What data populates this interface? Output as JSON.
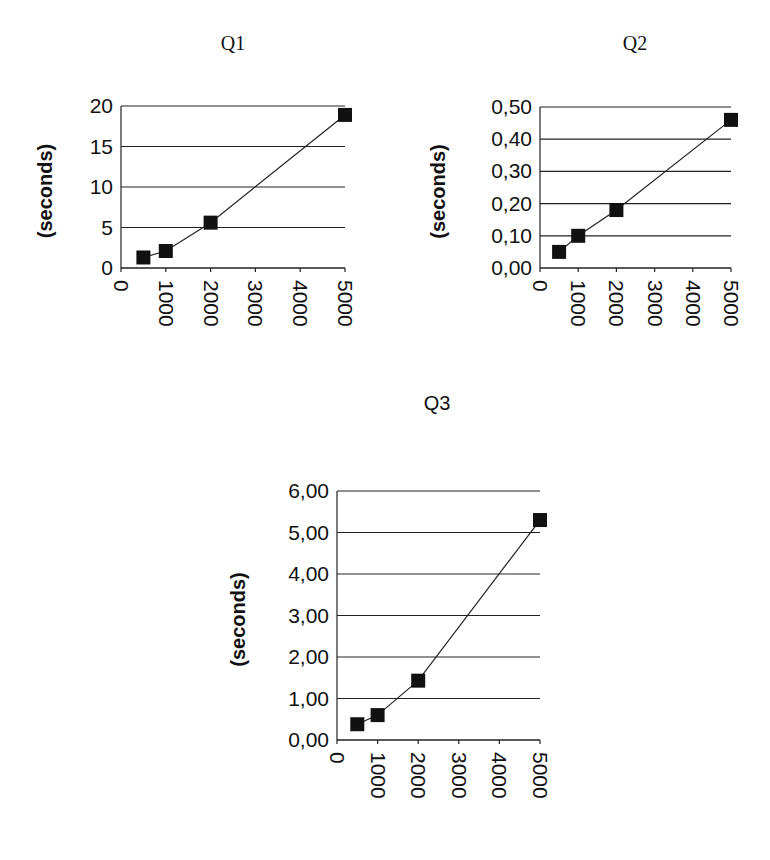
{
  "chart_data": [
    {
      "id": "q1",
      "type": "line",
      "title": "Q1",
      "xlabel": "",
      "ylabel": "(seconds)",
      "x": [
        500,
        1000,
        2000,
        5000
      ],
      "series": [
        {
          "name": "Q1",
          "values": [
            1.3,
            2.1,
            5.6,
            18.9
          ]
        }
      ],
      "xlim": [
        0,
        5000
      ],
      "ylim": [
        0,
        20
      ],
      "xticks": [
        "0",
        "1000",
        "2000",
        "3000",
        "4000",
        "5000"
      ],
      "yticks": [
        "0",
        "5",
        "10",
        "15",
        "20"
      ],
      "grid": "horizontal",
      "marker": "square",
      "legend": "none"
    },
    {
      "id": "q2",
      "type": "line",
      "title": "Q2",
      "xlabel": "",
      "ylabel": "(seconds)",
      "x": [
        500,
        1000,
        2000,
        5000
      ],
      "series": [
        {
          "name": "Q2",
          "values": [
            0.05,
            0.1,
            0.18,
            0.46
          ]
        }
      ],
      "xlim": [
        0,
        5000
      ],
      "ylim": [
        0,
        0.5
      ],
      "xticks": [
        "0",
        "1000",
        "2000",
        "3000",
        "4000",
        "5000"
      ],
      "yticks": [
        "0,00",
        "0,10",
        "0,20",
        "0,30",
        "0,40",
        "0,50"
      ],
      "grid": "horizontal",
      "marker": "square",
      "legend": "none"
    },
    {
      "id": "q3",
      "type": "line",
      "title": "Q3",
      "xlabel": "",
      "ylabel": "(seconds)",
      "x": [
        500,
        1000,
        2000,
        5000
      ],
      "series": [
        {
          "name": "Q3",
          "values": [
            0.38,
            0.6,
            1.43,
            5.3
          ]
        }
      ],
      "xlim": [
        0,
        5000
      ],
      "ylim": [
        0,
        6
      ],
      "xticks": [
        "0",
        "1000",
        "2000",
        "3000",
        "4000",
        "5000"
      ],
      "yticks": [
        "0,00",
        "1,00",
        "2,00",
        "3,00",
        "4,00",
        "5,00",
        "6,00"
      ],
      "grid": "horizontal",
      "marker": "square",
      "legend": "none"
    }
  ],
  "layout": {
    "charts": [
      {
        "left": 121,
        "top": 106,
        "width": 224,
        "height": 162,
        "title_x": 233,
        "title_y": 50,
        "title_font": "serif",
        "ylabel_x": 52
      },
      {
        "left": 540,
        "top": 107,
        "width": 191,
        "height": 161,
        "title_x": 635,
        "title_y": 50,
        "title_font": "serif",
        "ylabel_x": 445
      },
      {
        "left": 337,
        "top": 491,
        "width": 203,
        "height": 249,
        "title_x": 437,
        "title_y": 410,
        "title_font": "sans",
        "ylabel_x": 245
      }
    ]
  }
}
